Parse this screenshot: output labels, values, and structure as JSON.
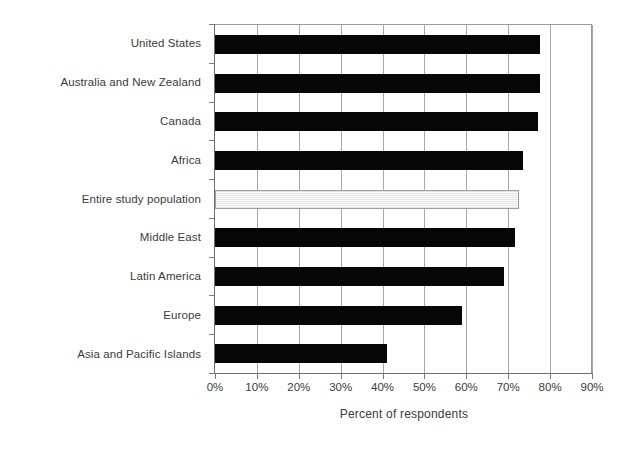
{
  "chart_data": {
    "type": "bar",
    "orientation": "horizontal",
    "title": "",
    "xlabel": "Percent of respondents",
    "ylabel": "",
    "xlim": [
      0,
      90
    ],
    "xtick_labels": [
      "0%",
      "10%",
      "20%",
      "30%",
      "40%",
      "50%",
      "60%",
      "70%",
      "80%",
      "90%"
    ],
    "xtick_values": [
      0,
      10,
      20,
      30,
      40,
      50,
      60,
      70,
      80,
      90
    ],
    "grid": "vertical",
    "legend": "none",
    "categories": [
      "United States",
      "Australia and New Zealand",
      "Canada",
      "Africa",
      "Entire study population",
      "Middle East",
      "Latin America",
      "Europe",
      "Asia and Pacific Islands"
    ],
    "values": [
      77.5,
      77.5,
      77,
      73.5,
      72.5,
      71.5,
      69,
      59,
      41
    ],
    "highlight_category": "Entire study population",
    "series": [
      {
        "name": "Percent of respondents",
        "values": [
          77.5,
          77.5,
          77,
          73.5,
          72.5,
          71.5,
          69,
          59,
          41
        ]
      }
    ],
    "colors": {
      "bar": "#060606",
      "highlight_bar": "#f2f2f2",
      "highlight_bar_border": "#9d9d9d",
      "gridline": "#a8a8a8",
      "axis": "#6f6f6f",
      "text": "#3b3b3b",
      "background": "#ffffff"
    }
  }
}
